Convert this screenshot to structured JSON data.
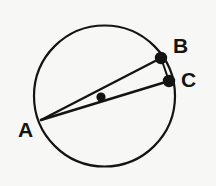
{
  "figure": {
    "kind": "geometry-diagram",
    "width": 216,
    "height": 186,
    "background_color": "#f7f7f6",
    "stroke_color": "#141414",
    "fill_color": "#141414"
  },
  "circle": {
    "name": "main-circle",
    "center_x": 104.5,
    "center_y": 96,
    "radius": 70.5,
    "stroke_width": 2.2,
    "fill": "none"
  },
  "center_point": {
    "name": "circle-center-dot",
    "x": 101,
    "y": 97,
    "radius": 4.6,
    "label": ""
  },
  "points": [
    {
      "id": "A",
      "label": "A",
      "x": 41,
      "y": 120,
      "dot": false,
      "dot_radius": 0,
      "label_x": 18,
      "label_y": 119
    },
    {
      "id": "B",
      "label": "B",
      "x": 161,
      "y": 58,
      "dot": true,
      "dot_radius": 6.2,
      "label_x": 173,
      "label_y": 35
    },
    {
      "id": "C",
      "label": "C",
      "x": 169,
      "y": 81,
      "dot": true,
      "dot_radius": 6.2,
      "label_x": 181,
      "label_y": 69
    }
  ],
  "segments": [
    {
      "name": "segment-AB",
      "from": "A",
      "to": "B",
      "x1": 41,
      "y1": 120,
      "x2": 161,
      "y2": 58,
      "stroke_width": 2.4
    },
    {
      "name": "segment-AC",
      "from": "A",
      "to": "C",
      "x1": 41,
      "y1": 120,
      "x2": 169,
      "y2": 81,
      "stroke_width": 2.4
    },
    {
      "name": "segment-BC",
      "from": "B",
      "to": "C",
      "x1": 161,
      "y1": 58,
      "x2": 169,
      "y2": 81,
      "stroke_width": 2.0
    }
  ],
  "labels": {
    "a": "A",
    "b": "B",
    "c": "C"
  }
}
